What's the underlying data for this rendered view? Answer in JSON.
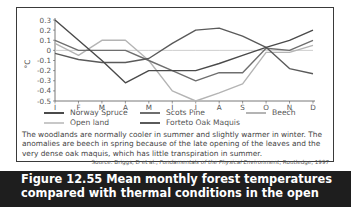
{
  "chart_data": {
    "type": "line",
    "title": "",
    "xlabel": "",
    "ylabel": "°C",
    "categories": [
      "J",
      "F",
      "M",
      "A",
      "M",
      "J",
      "J",
      "A",
      "S",
      "O",
      "N",
      "D"
    ],
    "ylim": [
      -0.5,
      0.3
    ],
    "yticks": [
      0.3,
      0.2,
      0.1,
      0,
      -0.1,
      -0.2,
      -0.3,
      -0.4,
      -0.5
    ],
    "ytick_labels": [
      "0.3",
      "0.2",
      "0.1",
      "0",
      "-0.1",
      "-0.2",
      "-0.3",
      "-0.4",
      "-0.5"
    ],
    "grid": false,
    "legend_position": "bottom",
    "series": [
      {
        "name": "Norway Spruce",
        "color": "#4a4a4a",
        "values": [
          0.3,
          0.1,
          -0.1,
          -0.32,
          -0.2,
          -0.2,
          -0.2,
          -0.13,
          -0.05,
          0.03,
          0.1,
          0.2
        ]
      },
      {
        "name": "Scots Pine",
        "color": "#6e6e6e",
        "values": [
          0.1,
          0.0,
          0.0,
          0.0,
          -0.1,
          -0.2,
          -0.3,
          -0.22,
          -0.22,
          0.02,
          0.0,
          0.1
        ]
      },
      {
        "name": "Beech",
        "color": "#b4b4b4",
        "values": [
          0.07,
          -0.05,
          0.1,
          0.1,
          -0.1,
          -0.4,
          -0.5,
          -0.42,
          -0.33,
          -0.02,
          -0.02,
          0.05
        ]
      },
      {
        "name": "Open land",
        "color": "#c8c8c8",
        "values": [
          0,
          0,
          0,
          0,
          0,
          0,
          0,
          0,
          0,
          0,
          0,
          0
        ]
      },
      {
        "name": "Forteto Oak Maquis",
        "color": "#5a5a5a",
        "values": [
          -0.03,
          -0.09,
          -0.12,
          -0.12,
          -0.08,
          0.07,
          0.2,
          0.22,
          0.14,
          0.03,
          -0.18,
          -0.23
        ]
      }
    ]
  },
  "legend": {
    "items": [
      {
        "label": "Norway Spruce",
        "color": "#4a4a4a"
      },
      {
        "label": "Scots Pine",
        "color": "#6e6e6e"
      },
      {
        "label": "Beech",
        "color": "#b4b4b4"
      },
      {
        "label": "Open land",
        "color": "#c8c8c8"
      },
      {
        "label": "Forteto Oak Maquis",
        "color": "#5a5a5a"
      }
    ]
  },
  "description": "The woodlands are normally cooler in summer and slightly warmer in winter. The anomalies are beech in spring because of the late opening of the leaves and the very dense oak maquis, which has little transpiration in summer.",
  "source": {
    "prefix": "Source: Briggs, D et al., ",
    "title": "Fundamentals of the Physical Environment",
    "suffix": ", Routledge, 1997"
  },
  "caption": {
    "figure_label": "Figure 12.55",
    "text": "Mean monthly forest temperatures compared with thermal conditions in the open"
  }
}
